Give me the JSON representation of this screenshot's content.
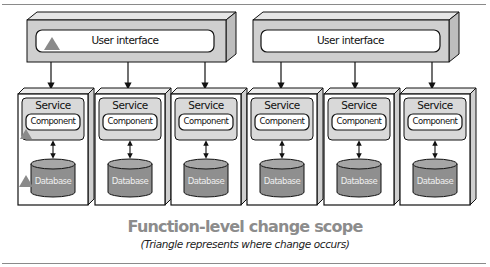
{
  "diagram": {
    "title": "Function-level change scope",
    "subtitle": "(Triangle represents where change occurs)",
    "user_interfaces": [
      {
        "label": "User interface",
        "has_change_triangle": true
      },
      {
        "label": "User interface",
        "has_change_triangle": false
      }
    ],
    "services": [
      {
        "service_label": "Service",
        "component_label": "Component",
        "database_label": "Database",
        "component_changed": true,
        "database_changed": true
      },
      {
        "service_label": "Service",
        "component_label": "Component",
        "database_label": "Database",
        "component_changed": false,
        "database_changed": false
      },
      {
        "service_label": "Service",
        "component_label": "Component",
        "database_label": "Database",
        "component_changed": false,
        "database_changed": false
      },
      {
        "service_label": "Service",
        "component_label": "Component",
        "database_label": "Database",
        "component_changed": false,
        "database_changed": false
      },
      {
        "service_label": "Service",
        "component_label": "Component",
        "database_label": "Database",
        "component_changed": false,
        "database_changed": false
      },
      {
        "service_label": "Service",
        "component_label": "Component",
        "database_label": "Database",
        "component_changed": false,
        "database_changed": false
      }
    ],
    "colors": {
      "ui_box_fill": "#cfcfcf",
      "service_inner_fill": "#d9d9d9",
      "database_fill": "#8f8f8f",
      "triangle_fill": "#8a8a8a",
      "title_color": "#8c8c8c"
    }
  }
}
